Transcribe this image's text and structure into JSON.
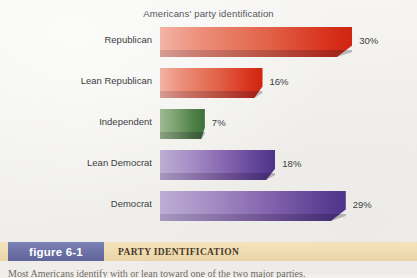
{
  "chart_data": {
    "type": "bar",
    "orientation": "horizontal",
    "title": "Americans' party identification",
    "xlabel": "",
    "ylabel": "",
    "xlim": [
      0,
      32
    ],
    "grid": false,
    "legend": "none",
    "categories": [
      "Republican",
      "Lean Republican",
      "Independent",
      "Lean Democrat",
      "Democrat"
    ],
    "values": [
      30,
      16,
      7,
      18,
      29
    ],
    "value_labels": [
      "30%",
      "16%",
      "7%",
      "18%",
      "29%"
    ],
    "colors": [
      "#d8351f",
      "#d8351f",
      "#4f8046",
      "#6b4aa0",
      "#6b4aa0"
    ],
    "series": [
      {
        "name": "Party identification",
        "values": [
          30,
          16,
          7,
          18,
          29
        ]
      }
    ]
  },
  "figure": {
    "badge_label": "figure 6-1",
    "caption": "PARTY IDENTIFICATION",
    "badge_color": "#6b71a6",
    "strip_color": "#efdcb3"
  },
  "page": {
    "body_text_sliver": "Most Americans identify with or lean toward one of the two major parties."
  }
}
